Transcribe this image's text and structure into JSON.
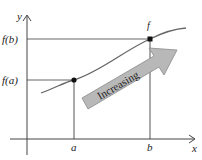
{
  "diagram": {
    "axes": {
      "x_label": "x",
      "y_label": "y"
    },
    "x_ticks": [
      {
        "label": "a"
      },
      {
        "label": "b"
      }
    ],
    "y_ticks": [
      {
        "label": "f(b)"
      },
      {
        "label": "f(a)"
      }
    ],
    "curve_label": "f",
    "arrow_label": "Increasing",
    "colors": {
      "axis": "#555555",
      "curve": "#666666",
      "arrow_fill": "#b5b5b5",
      "arrow_stroke": "#7a7a7a",
      "point": "#111111"
    }
  }
}
